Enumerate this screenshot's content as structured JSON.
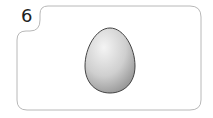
{
  "card": {
    "number": "6",
    "image": "egg-icon",
    "colors": {
      "border": "#b8b8b8",
      "egg_light": "#f2f2f2",
      "egg_dark": "#9a9a9a",
      "egg_outline": "#444444"
    }
  }
}
